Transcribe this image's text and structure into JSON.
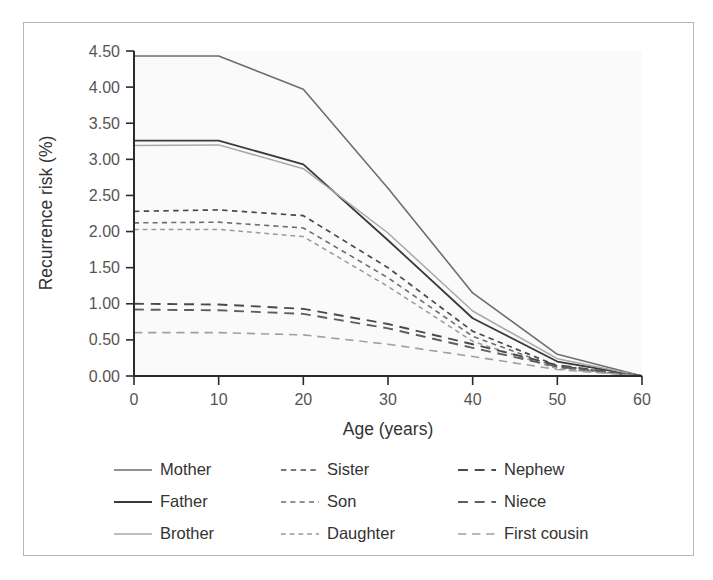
{
  "chart_data": {
    "type": "line",
    "title": "",
    "xlabel": "Age (years)",
    "ylabel": "Recurrence risk (%)",
    "xlim": [
      0,
      60
    ],
    "ylim": [
      0,
      4.5
    ],
    "xticks": [
      0,
      10,
      20,
      30,
      40,
      50,
      60
    ],
    "xtick_labels": [
      "0",
      "10",
      "20",
      "30",
      "40",
      "50",
      "60"
    ],
    "yticks": [
      0.0,
      0.5,
      1.0,
      1.5,
      2.0,
      2.5,
      3.0,
      3.5,
      4.0,
      4.5
    ],
    "ytick_labels": [
      "0.00",
      "0.50",
      "1.00",
      "1.50",
      "2.00",
      "2.50",
      "3.00",
      "3.50",
      "4.00",
      "4.50"
    ],
    "grid": false,
    "legend_position": "below",
    "legend_columns": 3,
    "x": [
      0,
      10,
      20,
      30,
      40,
      50,
      60
    ],
    "series": [
      {
        "name": "Mother",
        "values": [
          4.43,
          4.43,
          3.97,
          2.6,
          1.15,
          0.3,
          0.0
        ],
        "style": "solid",
        "color": "#6e6e6e",
        "width": 1.6
      },
      {
        "name": "Father",
        "values": [
          3.26,
          3.26,
          2.93,
          1.88,
          0.8,
          0.2,
          0.0
        ],
        "style": "solid",
        "color": "#3a3a3a",
        "width": 1.8
      },
      {
        "name": "Brother",
        "values": [
          3.19,
          3.2,
          2.87,
          1.98,
          0.9,
          0.24,
          0.0
        ],
        "style": "solid",
        "color": "#a8a8a8",
        "width": 1.5
      },
      {
        "name": "Sister",
        "values": [
          2.28,
          2.3,
          2.22,
          1.5,
          0.62,
          0.14,
          0.0
        ],
        "style": "short-dash",
        "color": "#4a4a4a",
        "width": 1.7
      },
      {
        "name": "Son",
        "values": [
          2.12,
          2.13,
          2.05,
          1.36,
          0.55,
          0.12,
          0.0
        ],
        "style": "short-dash",
        "color": "#6e6e6e",
        "width": 1.6
      },
      {
        "name": "Daughter",
        "values": [
          2.03,
          2.03,
          1.93,
          1.24,
          0.48,
          0.1,
          0.0
        ],
        "style": "short-dash",
        "color": "#9a9a9a",
        "width": 1.5
      },
      {
        "name": "Nephew",
        "values": [
          1.0,
          0.99,
          0.93,
          0.72,
          0.44,
          0.15,
          0.0
        ],
        "style": "long-dash",
        "color": "#4a4a4a",
        "width": 1.9
      },
      {
        "name": "Niece",
        "values": [
          0.92,
          0.91,
          0.86,
          0.66,
          0.39,
          0.13,
          0.0
        ],
        "style": "long-dash",
        "color": "#5e5e5e",
        "width": 1.9
      },
      {
        "name": "First cousin",
        "values": [
          0.6,
          0.6,
          0.57,
          0.44,
          0.27,
          0.09,
          0.0
        ],
        "style": "long-dash",
        "color": "#a0a0a0",
        "width": 1.6
      }
    ]
  },
  "legend": {
    "columns": [
      {
        "items": [
          "Mother",
          "Father",
          "Brother"
        ]
      },
      {
        "items": [
          "Sister",
          "Son",
          "Daughter"
        ]
      },
      {
        "items": [
          "Nephew",
          "Niece",
          "First cousin"
        ]
      }
    ]
  },
  "colors": {
    "frame": "#b6b6b6",
    "axis": "#2b2b2b",
    "plot_background": "#fafafa",
    "text": "#333333"
  }
}
